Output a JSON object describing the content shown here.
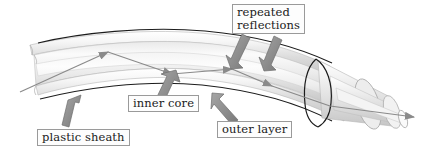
{
  "diagram": {
    "background_color": "#ffffff",
    "labels": {
      "repeated_reflections": "repeated\nreflections",
      "plastic_sheath": "plastic sheath",
      "inner_core": "inner core",
      "outer_layer": "outer layer"
    },
    "colors": {
      "label_text": "#1a1a1a",
      "label_border": "#9a9a9a",
      "label_fill": "#fdfdfd",
      "pointer_arrow": "#8e8e8e",
      "pointer_arrow_edge": "#6e6e6e",
      "light_ray": "#8a8a8a",
      "cable_outline": "#1c1c1c",
      "cable_light": "#f2f2f2",
      "cable_mid": "#d8d8d8",
      "cable_shade": "#bdbdbd"
    },
    "elements": {
      "cable": "curved fibre optic cable, cut away at both ends",
      "light_ray": "zig-zag ray bouncing between core walls, exits right end",
      "pointer_arrows": 5,
      "cut_band": "dark ellipse marking sheath cut at right"
    }
  }
}
